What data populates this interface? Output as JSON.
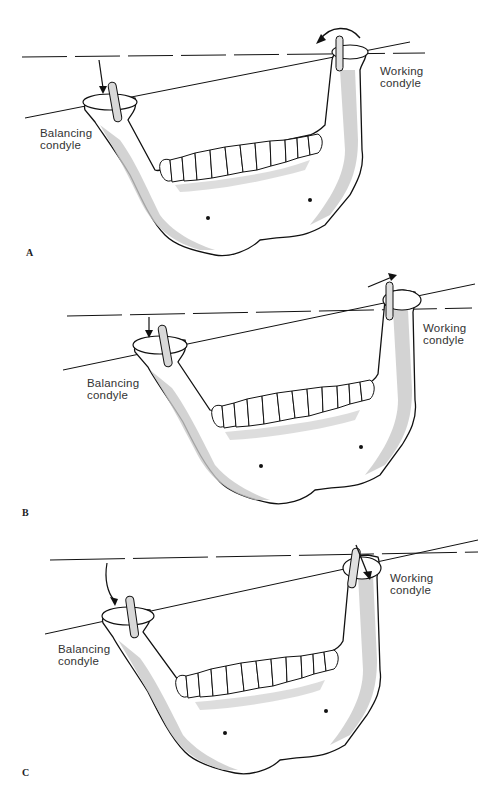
{
  "figure": {
    "panels": [
      {
        "id": "A",
        "letter": "A",
        "balancing_label": [
          "Balancing",
          "condyle"
        ],
        "working_label": [
          "Working",
          "condyle"
        ],
        "working_arrow": "rotation"
      },
      {
        "id": "B",
        "letter": "B",
        "balancing_label": [
          "Balancing",
          "condyle"
        ],
        "working_label": [
          "Working",
          "condyle"
        ],
        "working_arrow": "lateral-upward"
      },
      {
        "id": "C",
        "letter": "C",
        "balancing_label": [
          "Balancing",
          "condyle"
        ],
        "working_label": [
          "Working",
          "condyle"
        ],
        "working_arrow": "downward"
      }
    ]
  },
  "colors": {
    "bone_shade": "#c8c8c8",
    "outline": "#111111",
    "background": "#ffffff"
  }
}
